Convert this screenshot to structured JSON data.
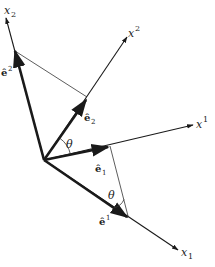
{
  "diagram": {
    "colors": {
      "axis": "#1a1a1a",
      "thin_line": "#333333",
      "background": "#ffffff"
    },
    "origin": [
      44,
      160
    ],
    "axes": [
      {
        "id": "x_sub_2",
        "label": "x",
        "index": "2",
        "index_pos": "sub",
        "tip": [
          6,
          18
        ]
      },
      {
        "id": "x_sup_2",
        "label": "x",
        "index": "2",
        "index_pos": "sup",
        "tip": [
          127,
          37
        ]
      },
      {
        "id": "x_sup_1",
        "label": "x",
        "index": "1",
        "index_pos": "sup",
        "tip": [
          193,
          125
        ]
      },
      {
        "id": "x_sub_1",
        "label": "x",
        "index": "1",
        "index_pos": "sub",
        "tip": [
          178,
          250
        ]
      }
    ],
    "vectors": [
      {
        "id": "e_sup_2",
        "symbol": "ê",
        "index": "2",
        "index_pos": "sup",
        "tip": [
          15,
          51
        ]
      },
      {
        "id": "e_sub_2",
        "symbol": "ê",
        "index": "2",
        "index_pos": "sub",
        "tip": [
          86,
          100
        ]
      },
      {
        "id": "e_sub_1",
        "symbol": "ê",
        "index": "1",
        "index_pos": "sub",
        "tip": [
          108,
          147
        ]
      },
      {
        "id": "e_sup_1",
        "symbol": "ê",
        "index": "1",
        "index_pos": "sup",
        "tip": [
          127,
          217
        ]
      }
    ],
    "angles": [
      {
        "id": "theta_top",
        "symbol": "θ"
      },
      {
        "id": "theta_bottom",
        "symbol": "θ"
      }
    ]
  }
}
